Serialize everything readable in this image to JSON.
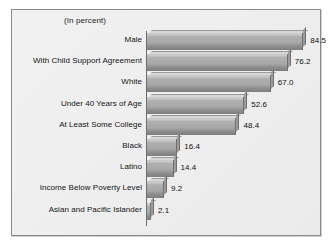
{
  "chart": {
    "title": "(In percent)",
    "axis_max": 92
  },
  "chart_data": {
    "type": "bar",
    "orientation": "horizontal",
    "title": "(In percent)",
    "xlabel": "",
    "ylabel": "",
    "xlim": [
      0,
      92
    ],
    "grid": false,
    "legend": null,
    "categories": [
      "Male",
      "With Child Support Agreement",
      "White",
      "Under 40 Years of Age",
      "At Least Some College",
      "Black",
      "Latino",
      "Income Below Poverty Level",
      "Asian and Pacific Islander"
    ],
    "values": [
      84.5,
      76.2,
      67.0,
      52.6,
      48.4,
      16.4,
      14.4,
      9.2,
      2.1
    ],
    "value_labels": [
      "84.5",
      "76.2",
      "67.0",
      "52.6",
      "48.4",
      "16.4",
      "14.4",
      "9.2",
      "2.1"
    ],
    "colors": {
      "bar_face": "#a6a6a6",
      "bar_top": "#d7d7d7",
      "bar_shadow": "#7e7e7e",
      "panel_background": "#eeeeee",
      "panel_border": "#8a8a8a",
      "text": "#141414",
      "axis": "#6e6e6e"
    }
  }
}
